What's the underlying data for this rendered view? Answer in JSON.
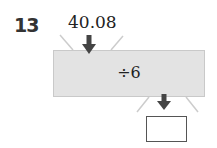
{
  "problem": {
    "number": "13",
    "input_value": "40.08",
    "operation": "÷6",
    "answer": ""
  },
  "colors": {
    "machine_fill": "#e3e3e3",
    "arrow": "#444444",
    "guide_lines": "#cccccc"
  }
}
